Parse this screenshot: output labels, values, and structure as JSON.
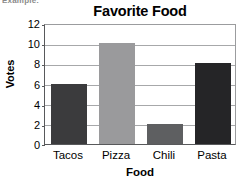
{
  "page_fragment": "Example:",
  "chart_data": {
    "type": "bar",
    "title": "Favorite Food",
    "xlabel": "Food",
    "ylabel": "Votes",
    "categories": [
      "Tacos",
      "Pizza",
      "Chili",
      "Pasta"
    ],
    "values": [
      6,
      10,
      2,
      8
    ],
    "bar_colors": [
      "#3b3b3d",
      "#9a9a9c",
      "#5e5f61",
      "#252527"
    ],
    "ylim": [
      0,
      12
    ],
    "ytick_step": 2,
    "ytick_labels": [
      "0",
      "2",
      "4",
      "6",
      "8",
      "10",
      "12"
    ],
    "grid": true,
    "legend": "none",
    "axis_color": "#58595b",
    "gridline_color": "#a7a8aa",
    "background": "#ffffff"
  }
}
